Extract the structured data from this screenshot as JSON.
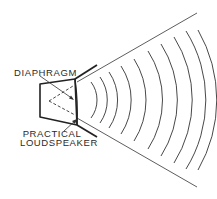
{
  "diagram": {
    "labels": {
      "diaphragm": "DIAPHRAGM",
      "practical_line1": "PRACTICAL",
      "practical_line2": "LOUDSPEAKER"
    },
    "colors": {
      "ink": "#2a2a2a",
      "background": "#ffffff"
    },
    "wave_count": 10
  }
}
